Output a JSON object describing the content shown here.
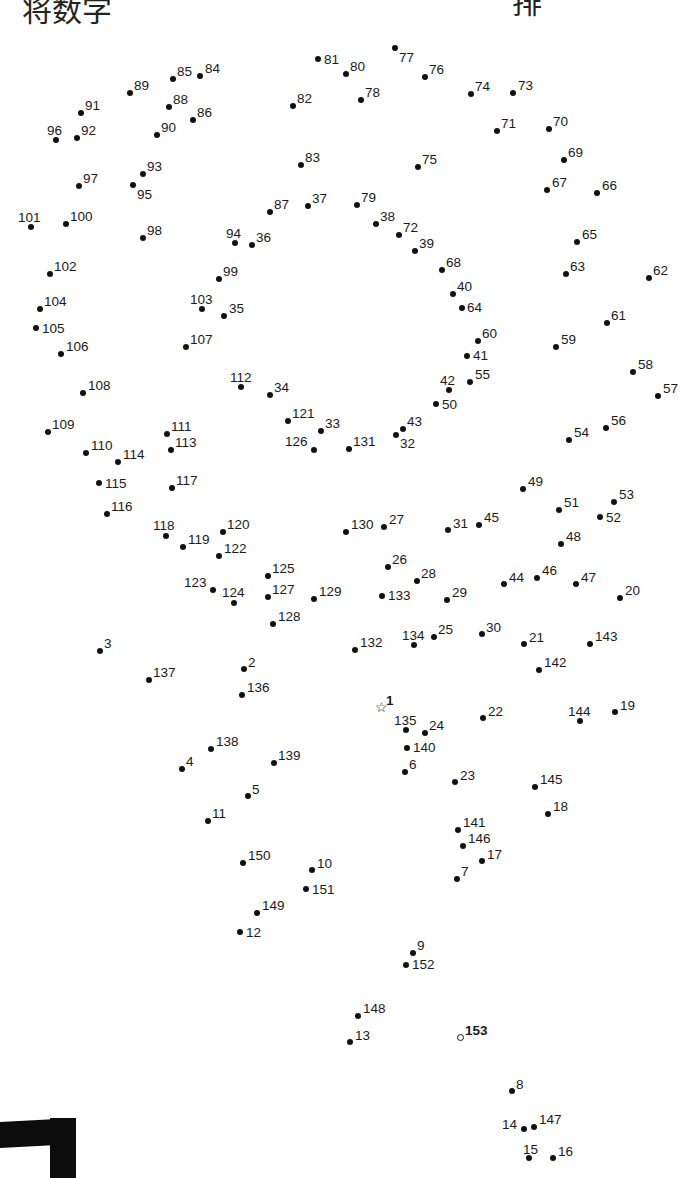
{
  "page": {
    "header_left_fragment": "将数字",
    "header_right_fragment": "排",
    "start_marker": "star",
    "end_marker": "open-circle"
  },
  "dots": [
    {
      "n": "1",
      "x": 381,
      "y": 708,
      "lx": 386,
      "ly": 694,
      "type": "start",
      "bold": true
    },
    {
      "n": "2",
      "x": 244,
      "y": 669,
      "lx": 248,
      "ly": 656
    },
    {
      "n": "3",
      "x": 100,
      "y": 651,
      "lx": 104,
      "ly": 637
    },
    {
      "n": "4",
      "x": 182,
      "y": 769,
      "lx": 186,
      "ly": 755
    },
    {
      "n": "5",
      "x": 248,
      "y": 796,
      "lx": 252,
      "ly": 783
    },
    {
      "n": "6",
      "x": 405,
      "y": 772,
      "lx": 409,
      "ly": 758
    },
    {
      "n": "7",
      "x": 457,
      "y": 879,
      "lx": 461,
      "ly": 865
    },
    {
      "n": "8",
      "x": 512,
      "y": 1091,
      "lx": 516,
      "ly": 1078
    },
    {
      "n": "9",
      "x": 413,
      "y": 953,
      "lx": 417,
      "ly": 939
    },
    {
      "n": "10",
      "x": 312,
      "y": 870,
      "lx": 317,
      "ly": 857
    },
    {
      "n": "11",
      "x": 208,
      "y": 821,
      "lx": 212,
      "ly": 807
    },
    {
      "n": "12",
      "x": 240,
      "y": 932,
      "lx": 246,
      "ly": 926
    },
    {
      "n": "13",
      "x": 350,
      "y": 1042,
      "lx": 355,
      "ly": 1029
    },
    {
      "n": "14",
      "x": 524,
      "y": 1129,
      "lx": 502,
      "ly": 1118
    },
    {
      "n": "15",
      "x": 529,
      "y": 1158,
      "lx": 523,
      "ly": 1143
    },
    {
      "n": "16",
      "x": 553,
      "y": 1158,
      "lx": 558,
      "ly": 1145
    },
    {
      "n": "17",
      "x": 482,
      "y": 861,
      "lx": 487,
      "ly": 848
    },
    {
      "n": "18",
      "x": 548,
      "y": 814,
      "lx": 553,
      "ly": 800
    },
    {
      "n": "19",
      "x": 615,
      "y": 712,
      "lx": 620,
      "ly": 699
    },
    {
      "n": "20",
      "x": 620,
      "y": 598,
      "lx": 625,
      "ly": 584
    },
    {
      "n": "21",
      "x": 524,
      "y": 644,
      "lx": 529,
      "ly": 631
    },
    {
      "n": "22",
      "x": 483,
      "y": 718,
      "lx": 488,
      "ly": 705
    },
    {
      "n": "23",
      "x": 455,
      "y": 782,
      "lx": 460,
      "ly": 769
    },
    {
      "n": "24",
      "x": 425,
      "y": 733,
      "lx": 429,
      "ly": 719
    },
    {
      "n": "25",
      "x": 434,
      "y": 637,
      "lx": 438,
      "ly": 623
    },
    {
      "n": "26",
      "x": 388,
      "y": 567,
      "lx": 392,
      "ly": 553
    },
    {
      "n": "27",
      "x": 384,
      "y": 527,
      "lx": 389,
      "ly": 513
    },
    {
      "n": "28",
      "x": 417,
      "y": 581,
      "lx": 421,
      "ly": 567
    },
    {
      "n": "29",
      "x": 447,
      "y": 600,
      "lx": 452,
      "ly": 586
    },
    {
      "n": "30",
      "x": 482,
      "y": 634,
      "lx": 486,
      "ly": 621
    },
    {
      "n": "31",
      "x": 448,
      "y": 530,
      "lx": 453,
      "ly": 517
    },
    {
      "n": "32",
      "x": 396,
      "y": 435,
      "lx": 400,
      "ly": 437
    },
    {
      "n": "33",
      "x": 321,
      "y": 431,
      "lx": 325,
      "ly": 417
    },
    {
      "n": "34",
      "x": 270,
      "y": 395,
      "lx": 274,
      "ly": 381
    },
    {
      "n": "35",
      "x": 224,
      "y": 316,
      "lx": 229,
      "ly": 302
    },
    {
      "n": "36",
      "x": 252,
      "y": 245,
      "lx": 256,
      "ly": 231
    },
    {
      "n": "37",
      "x": 308,
      "y": 206,
      "lx": 312,
      "ly": 192
    },
    {
      "n": "38",
      "x": 376,
      "y": 224,
      "lx": 380,
      "ly": 210
    },
    {
      "n": "39",
      "x": 415,
      "y": 251,
      "lx": 419,
      "ly": 237
    },
    {
      "n": "40",
      "x": 453,
      "y": 294,
      "lx": 457,
      "ly": 280
    },
    {
      "n": "41",
      "x": 467,
      "y": 356,
      "lx": 473,
      "ly": 349
    },
    {
      "n": "42",
      "x": 449,
      "y": 390,
      "lx": 440,
      "ly": 374
    },
    {
      "n": "43",
      "x": 403,
      "y": 429,
      "lx": 407,
      "ly": 415
    },
    {
      "n": "44",
      "x": 504,
      "y": 584,
      "lx": 509,
      "ly": 571
    },
    {
      "n": "45",
      "x": 479,
      "y": 525,
      "lx": 484,
      "ly": 511
    },
    {
      "n": "46",
      "x": 537,
      "y": 578,
      "lx": 542,
      "ly": 564
    },
    {
      "n": "47",
      "x": 576,
      "y": 584,
      "lx": 581,
      "ly": 571
    },
    {
      "n": "48",
      "x": 561,
      "y": 544,
      "lx": 566,
      "ly": 530
    },
    {
      "n": "49",
      "x": 523,
      "y": 489,
      "lx": 528,
      "ly": 475
    },
    {
      "n": "50",
      "x": 436,
      "y": 404,
      "lx": 442,
      "ly": 398
    },
    {
      "n": "51",
      "x": 559,
      "y": 510,
      "lx": 564,
      "ly": 496
    },
    {
      "n": "52",
      "x": 600,
      "y": 517,
      "lx": 606,
      "ly": 511
    },
    {
      "n": "53",
      "x": 614,
      "y": 502,
      "lx": 619,
      "ly": 488
    },
    {
      "n": "54",
      "x": 569,
      "y": 440,
      "lx": 574,
      "ly": 426
    },
    {
      "n": "55",
      "x": 470,
      "y": 382,
      "lx": 475,
      "ly": 368
    },
    {
      "n": "56",
      "x": 606,
      "y": 428,
      "lx": 611,
      "ly": 414
    },
    {
      "n": "57",
      "x": 658,
      "y": 396,
      "lx": 663,
      "ly": 382
    },
    {
      "n": "58",
      "x": 633,
      "y": 372,
      "lx": 638,
      "ly": 358
    },
    {
      "n": "59",
      "x": 556,
      "y": 347,
      "lx": 561,
      "ly": 333
    },
    {
      "n": "60",
      "x": 478,
      "y": 341,
      "lx": 482,
      "ly": 327
    },
    {
      "n": "61",
      "x": 607,
      "y": 323,
      "lx": 611,
      "ly": 309
    },
    {
      "n": "62",
      "x": 649,
      "y": 278,
      "lx": 653,
      "ly": 264
    },
    {
      "n": "63",
      "x": 566,
      "y": 274,
      "lx": 570,
      "ly": 260
    },
    {
      "n": "64",
      "x": 462,
      "y": 308,
      "lx": 467,
      "ly": 301
    },
    {
      "n": "65",
      "x": 577,
      "y": 242,
      "lx": 582,
      "ly": 228
    },
    {
      "n": "66",
      "x": 597,
      "y": 193,
      "lx": 602,
      "ly": 179
    },
    {
      "n": "67",
      "x": 547,
      "y": 190,
      "lx": 552,
      "ly": 176
    },
    {
      "n": "68",
      "x": 442,
      "y": 270,
      "lx": 446,
      "ly": 256
    },
    {
      "n": "69",
      "x": 564,
      "y": 160,
      "lx": 568,
      "ly": 146
    },
    {
      "n": "70",
      "x": 549,
      "y": 129,
      "lx": 553,
      "ly": 115
    },
    {
      "n": "71",
      "x": 497,
      "y": 131,
      "lx": 501,
      "ly": 117
    },
    {
      "n": "72",
      "x": 399,
      "y": 235,
      "lx": 403,
      "ly": 221
    },
    {
      "n": "73",
      "x": 513,
      "y": 93,
      "lx": 518,
      "ly": 79
    },
    {
      "n": "74",
      "x": 471,
      "y": 94,
      "lx": 475,
      "ly": 80
    },
    {
      "n": "75",
      "x": 418,
      "y": 167,
      "lx": 422,
      "ly": 153
    },
    {
      "n": "76",
      "x": 425,
      "y": 77,
      "lx": 429,
      "ly": 63
    },
    {
      "n": "77",
      "x": 395,
      "y": 48,
      "lx": 399,
      "ly": 51
    },
    {
      "n": "78",
      "x": 361,
      "y": 100,
      "lx": 365,
      "ly": 86
    },
    {
      "n": "79",
      "x": 357,
      "y": 205,
      "lx": 361,
      "ly": 191
    },
    {
      "n": "80",
      "x": 346,
      "y": 74,
      "lx": 350,
      "ly": 60
    },
    {
      "n": "81",
      "x": 318,
      "y": 59,
      "lx": 324,
      "ly": 53
    },
    {
      "n": "82",
      "x": 293,
      "y": 106,
      "lx": 297,
      "ly": 92
    },
    {
      "n": "83",
      "x": 301,
      "y": 165,
      "lx": 305,
      "ly": 151
    },
    {
      "n": "84",
      "x": 200,
      "y": 76,
      "lx": 205,
      "ly": 62
    },
    {
      "n": "85",
      "x": 173,
      "y": 79,
      "lx": 177,
      "ly": 65
    },
    {
      "n": "86",
      "x": 193,
      "y": 120,
      "lx": 197,
      "ly": 106
    },
    {
      "n": "87",
      "x": 270,
      "y": 212,
      "lx": 274,
      "ly": 198
    },
    {
      "n": "88",
      "x": 169,
      "y": 107,
      "lx": 173,
      "ly": 93
    },
    {
      "n": "89",
      "x": 130,
      "y": 93,
      "lx": 134,
      "ly": 79
    },
    {
      "n": "90",
      "x": 157,
      "y": 135,
      "lx": 161,
      "ly": 121
    },
    {
      "n": "91",
      "x": 81,
      "y": 113,
      "lx": 85,
      "ly": 99
    },
    {
      "n": "92",
      "x": 77,
      "y": 138,
      "lx": 81,
      "ly": 124
    },
    {
      "n": "93",
      "x": 143,
      "y": 174,
      "lx": 147,
      "ly": 160
    },
    {
      "n": "94",
      "x": 235,
      "y": 243,
      "lx": 226,
      "ly": 227
    },
    {
      "n": "95",
      "x": 133,
      "y": 185,
      "lx": 137,
      "ly": 188
    },
    {
      "n": "96",
      "x": 56,
      "y": 140,
      "lx": 47,
      "ly": 124
    },
    {
      "n": "97",
      "x": 79,
      "y": 186,
      "lx": 83,
      "ly": 172
    },
    {
      "n": "98",
      "x": 143,
      "y": 238,
      "lx": 147,
      "ly": 224
    },
    {
      "n": "99",
      "x": 219,
      "y": 279,
      "lx": 223,
      "ly": 265
    },
    {
      "n": "100",
      "x": 66,
      "y": 224,
      "lx": 70,
      "ly": 210
    },
    {
      "n": "101",
      "x": 31,
      "y": 227,
      "lx": 18,
      "ly": 211
    },
    {
      "n": "102",
      "x": 50,
      "y": 274,
      "lx": 54,
      "ly": 260
    },
    {
      "n": "103",
      "x": 202,
      "y": 309,
      "lx": 190,
      "ly": 293
    },
    {
      "n": "104",
      "x": 40,
      "y": 309,
      "lx": 44,
      "ly": 295
    },
    {
      "n": "105",
      "x": 36,
      "y": 328,
      "lx": 42,
      "ly": 322
    },
    {
      "n": "106",
      "x": 61,
      "y": 354,
      "lx": 66,
      "ly": 340
    },
    {
      "n": "107",
      "x": 186,
      "y": 347,
      "lx": 190,
      "ly": 333
    },
    {
      "n": "108",
      "x": 83,
      "y": 393,
      "lx": 88,
      "ly": 379
    },
    {
      "n": "109",
      "x": 48,
      "y": 432,
      "lx": 52,
      "ly": 418
    },
    {
      "n": "110",
      "x": 86,
      "y": 453,
      "lx": 91,
      "ly": 439
    },
    {
      "n": "111",
      "x": 167,
      "y": 434,
      "lx": 171,
      "ly": 420
    },
    {
      "n": "112",
      "x": 241,
      "y": 387,
      "lx": 230,
      "ly": 371
    },
    {
      "n": "113",
      "x": 171,
      "y": 450,
      "lx": 175,
      "ly": 436
    },
    {
      "n": "114",
      "x": 118,
      "y": 462,
      "lx": 123,
      "ly": 448
    },
    {
      "n": "115",
      "x": 99,
      "y": 483,
      "lx": 105,
      "ly": 477
    },
    {
      "n": "116",
      "x": 107,
      "y": 514,
      "lx": 111,
      "ly": 500
    },
    {
      "n": "117",
      "x": 172,
      "y": 488,
      "lx": 176,
      "ly": 474
    },
    {
      "n": "118",
      "x": 166,
      "y": 536,
      "lx": 153,
      "ly": 519
    },
    {
      "n": "119",
      "x": 183,
      "y": 547,
      "lx": 188,
      "ly": 533
    },
    {
      "n": "120",
      "x": 223,
      "y": 532,
      "lx": 227,
      "ly": 518
    },
    {
      "n": "121",
      "x": 288,
      "y": 421,
      "lx": 292,
      "ly": 407
    },
    {
      "n": "122",
      "x": 219,
      "y": 556,
      "lx": 224,
      "ly": 542
    },
    {
      "n": "123",
      "x": 213,
      "y": 590,
      "lx": 184,
      "ly": 576
    },
    {
      "n": "124",
      "x": 234,
      "y": 603,
      "lx": 222,
      "ly": 586
    },
    {
      "n": "125",
      "x": 268,
      "y": 576,
      "lx": 272,
      "ly": 562
    },
    {
      "n": "126",
      "x": 314,
      "y": 450,
      "lx": 285,
      "ly": 435
    },
    {
      "n": "127",
      "x": 268,
      "y": 597,
      "lx": 272,
      "ly": 583
    },
    {
      "n": "128",
      "x": 273,
      "y": 624,
      "lx": 278,
      "ly": 610
    },
    {
      "n": "129",
      "x": 314,
      "y": 599,
      "lx": 319,
      "ly": 585
    },
    {
      "n": "130",
      "x": 346,
      "y": 532,
      "lx": 351,
      "ly": 518
    },
    {
      "n": "131",
      "x": 349,
      "y": 449,
      "lx": 353,
      "ly": 435
    },
    {
      "n": "132",
      "x": 355,
      "y": 650,
      "lx": 360,
      "ly": 636
    },
    {
      "n": "133",
      "x": 382,
      "y": 596,
      "lx": 388,
      "ly": 589
    },
    {
      "n": "134",
      "x": 414,
      "y": 645,
      "lx": 402,
      "ly": 629
    },
    {
      "n": "135",
      "x": 406,
      "y": 730,
      "lx": 394,
      "ly": 714
    },
    {
      "n": "136",
      "x": 242,
      "y": 695,
      "lx": 247,
      "ly": 681
    },
    {
      "n": "137",
      "x": 149,
      "y": 680,
      "lx": 153,
      "ly": 666
    },
    {
      "n": "138",
      "x": 211,
      "y": 749,
      "lx": 216,
      "ly": 735
    },
    {
      "n": "139",
      "x": 274,
      "y": 763,
      "lx": 278,
      "ly": 749
    },
    {
      "n": "140",
      "x": 407,
      "y": 748,
      "lx": 413,
      "ly": 741
    },
    {
      "n": "141",
      "x": 458,
      "y": 830,
      "lx": 463,
      "ly": 816
    },
    {
      "n": "142",
      "x": 539,
      "y": 670,
      "lx": 544,
      "ly": 656
    },
    {
      "n": "143",
      "x": 590,
      "y": 644,
      "lx": 595,
      "ly": 630
    },
    {
      "n": "144",
      "x": 580,
      "y": 721,
      "lx": 568,
      "ly": 705
    },
    {
      "n": "145",
      "x": 535,
      "y": 787,
      "lx": 540,
      "ly": 773
    },
    {
      "n": "146",
      "x": 463,
      "y": 846,
      "lx": 468,
      "ly": 832
    },
    {
      "n": "147",
      "x": 534,
      "y": 1127,
      "lx": 539,
      "ly": 1113
    },
    {
      "n": "148",
      "x": 358,
      "y": 1016,
      "lx": 363,
      "ly": 1002
    },
    {
      "n": "149",
      "x": 257,
      "y": 913,
      "lx": 262,
      "ly": 899
    },
    {
      "n": "150",
      "x": 243,
      "y": 863,
      "lx": 248,
      "ly": 849
    },
    {
      "n": "151",
      "x": 306,
      "y": 889,
      "lx": 312,
      "ly": 883
    },
    {
      "n": "152",
      "x": 406,
      "y": 965,
      "lx": 412,
      "ly": 958
    },
    {
      "n": "153",
      "x": 460,
      "y": 1037,
      "lx": 465,
      "ly": 1024,
      "type": "end",
      "bold": true
    }
  ],
  "decor": {
    "corner_mark_color": "#0c0c0c"
  }
}
